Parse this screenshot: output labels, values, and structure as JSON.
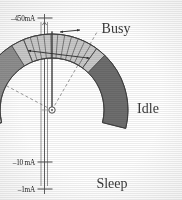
{
  "figure": {
    "background_color": "#ffffff",
    "ink_color": "#3a3a3a"
  },
  "axis": {
    "name": "current-scale",
    "unit": "mA",
    "orientation": "vertical",
    "ticks": [
      {
        "label": "–450mA",
        "value": -450,
        "y": 18
      },
      {
        "label": "–65 mA",
        "value": -65,
        "y": 45
      },
      {
        "label": "–10 mA",
        "value": -10,
        "y": 162
      },
      {
        "label": "–1mA",
        "value": -1,
        "y": 189
      }
    ]
  },
  "gauge": {
    "name": "state-arc",
    "center": {
      "x": 52,
      "y": 110
    },
    "inner_radius": 52,
    "outer_radius": 76,
    "start_angle_deg": -104,
    "end_angle_deg": 104,
    "segments": [
      {
        "id": "busy",
        "label": "Busy",
        "color": "#8e8e8e",
        "start_angle_deg": -104,
        "end_angle_deg": -32,
        "label_pos": {
          "x": 116,
          "y": 33
        }
      },
      {
        "id": "idle",
        "label": "Idle",
        "color": "#c9c9c9",
        "start_angle_deg": -32,
        "end_angle_deg": 44,
        "label_pos": {
          "x": 148,
          "y": 113
        }
      },
      {
        "id": "sleep",
        "label": "Sleep",
        "color": "#6e6e6e",
        "start_angle_deg": 44,
        "end_angle_deg": 104,
        "label_pos": {
          "x": 112,
          "y": 188
        }
      }
    ],
    "hatched_regions": [
      {
        "id": "busy-range",
        "label": "",
        "color": "#d2d2d2",
        "hatch": "radial",
        "start_angle_deg": -104,
        "end_angle_deg": -80,
        "arrow": "double-horizontal"
      },
      {
        "id": "idle-range",
        "label": "",
        "color": "#c9c9c9",
        "hatch": "cross-radial",
        "start_angle_deg": -22,
        "end_angle_deg": 36,
        "arrow": "double-vertical"
      }
    ],
    "needle": {
      "name": "gauge-needle",
      "angle_deg": 0,
      "length": 76,
      "pivot_radius": 3.2
    },
    "guides": [
      {
        "id": "guide-busy-start",
        "angle_deg": -62,
        "style": "dashed"
      },
      {
        "id": "guide-idle-end",
        "angle_deg": 30,
        "style": "dashed"
      }
    ]
  }
}
